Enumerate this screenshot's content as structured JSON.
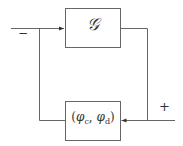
{
  "diagram": {
    "top_block": {
      "label": "𝒢"
    },
    "bottom_block": {
      "label": "(φc, φd)"
    },
    "input_sign_left": "−",
    "input_sign_right": "+",
    "colors": {
      "line": "#555555",
      "text": "#333333"
    }
  }
}
